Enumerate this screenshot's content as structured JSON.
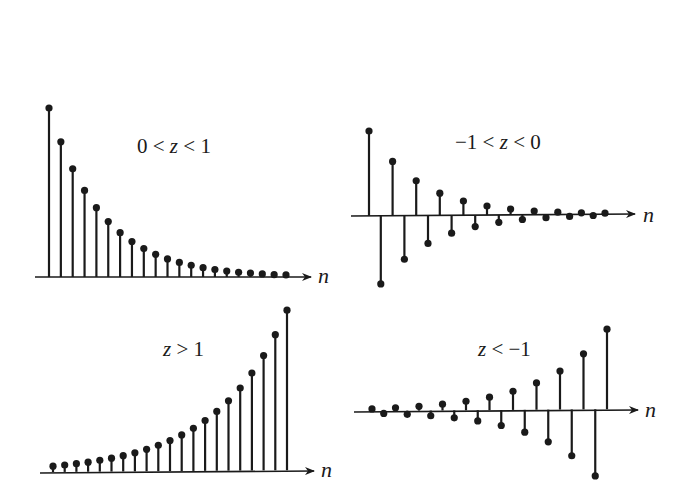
{
  "figure": {
    "ink_color": "#1a1a1a",
    "background": "#ffffff"
  },
  "chart_data": [
    {
      "type": "stem",
      "id": "top-left",
      "title": "0 < z < 1",
      "title_parts": [
        "0",
        " < ",
        "z",
        " < ",
        "1"
      ],
      "xlabel": "n",
      "ylabel": "",
      "z": 0.8,
      "n": [
        0,
        1,
        2,
        3,
        4,
        5,
        6,
        7,
        8,
        9,
        10,
        11,
        12,
        13,
        14,
        15,
        16,
        17,
        18,
        19,
        20
      ],
      "values": [
        1.0,
        0.8,
        0.64,
        0.512,
        0.41,
        0.328,
        0.262,
        0.21,
        0.168,
        0.134,
        0.107,
        0.086,
        0.069,
        0.055,
        0.044,
        0.035,
        0.028,
        0.023,
        0.018,
        0.014,
        0.012
      ],
      "ylim": [
        0,
        1
      ]
    },
    {
      "type": "stem",
      "id": "top-right",
      "title": "−1 < z < 0",
      "title_parts": [
        "−1",
        " < ",
        "z",
        " < ",
        "0"
      ],
      "xlabel": "n",
      "ylabel": "",
      "z": -0.8,
      "n": [
        0,
        1,
        2,
        3,
        4,
        5,
        6,
        7,
        8,
        9,
        10,
        11,
        12,
        13,
        14,
        15,
        16,
        17,
        18,
        19,
        20
      ],
      "values": [
        1.0,
        -0.8,
        0.64,
        -0.512,
        0.41,
        -0.328,
        0.262,
        -0.21,
        0.168,
        -0.134,
        0.107,
        -0.086,
        0.069,
        -0.055,
        0.044,
        -0.035,
        0.028,
        -0.023,
        0.018,
        -0.014,
        0.012
      ],
      "ylim": [
        -0.8,
        1
      ]
    },
    {
      "type": "stem",
      "id": "bottom-left",
      "title": "z > 1",
      "title_parts": [
        "z",
        " > ",
        "1"
      ],
      "xlabel": "n",
      "ylabel": "",
      "z": 1.18,
      "n": [
        0,
        1,
        2,
        3,
        4,
        5,
        6,
        7,
        8,
        9,
        10,
        11,
        12,
        13,
        14,
        15,
        16,
        17,
        18,
        19,
        20
      ],
      "values": [
        1.0,
        1.18,
        1.39,
        1.64,
        1.94,
        2.29,
        2.7,
        3.19,
        3.76,
        4.44,
        5.23,
        6.18,
        7.29,
        8.6,
        10.15,
        11.97,
        14.13,
        16.67,
        19.67,
        23.21,
        27.39
      ],
      "ylim": [
        0,
        27.39
      ]
    },
    {
      "type": "stem",
      "id": "bottom-right",
      "title": "z < −1",
      "title_parts": [
        "z",
        " < ",
        "−1"
      ],
      "xlabel": "n",
      "ylabel": "",
      "z": -1.2,
      "n": [
        0,
        1,
        2,
        3,
        4,
        5,
        6,
        7,
        8,
        9,
        10,
        11,
        12,
        13,
        14,
        15,
        16,
        17,
        18,
        19,
        20
      ],
      "values": [
        1.0,
        -1.2,
        1.44,
        -1.73,
        2.07,
        -2.49,
        2.99,
        -3.58,
        4.3,
        -5.16,
        6.19,
        -7.43,
        8.92,
        -10.7,
        12.84,
        -15.41,
        18.49,
        -22.19,
        26.62,
        -31.95,
        38.34
      ],
      "ylim": [
        -38.34,
        38.34
      ]
    }
  ]
}
